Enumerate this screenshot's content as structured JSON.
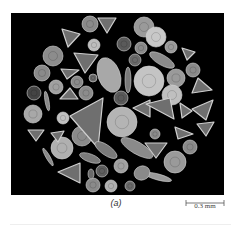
{
  "figure": {
    "panel_label": "(a)",
    "scale_bar": {
      "label": "0.3 mm"
    },
    "colors": {
      "background": "#000000",
      "specimen_light": "#c8c8c8",
      "specimen_mid": "#8c8c8c",
      "specimen_dark": "#5a5a5a",
      "page": "#ffffff"
    }
  },
  "specimens": {
    "circles": [
      [
        90,
        24,
        8,
        "#8a8a8a"
      ],
      [
        144,
        27,
        10,
        "#9a9a9a"
      ],
      [
        156,
        37,
        10,
        "#c8c8c8"
      ],
      [
        94,
        45,
        6,
        "#bdbdbd"
      ],
      [
        124,
        44,
        7,
        "#5a5a5a"
      ],
      [
        141,
        48,
        6,
        "#8a8a8a"
      ],
      [
        171,
        47,
        6,
        "#9a9a9a"
      ],
      [
        53,
        56,
        10,
        "#8c8c8c"
      ],
      [
        135,
        60,
        6,
        "#6a6a6a"
      ],
      [
        42,
        73,
        8,
        "#8a8a8a"
      ],
      [
        149,
        81,
        15,
        "#c4c4c4"
      ],
      [
        176,
        78,
        9,
        "#9a9a9a"
      ],
      [
        77,
        82,
        6,
        "#8a8a8a"
      ],
      [
        93,
        78,
        4,
        "#6a6a6a"
      ],
      [
        193,
        70,
        7,
        "#8a8a8a"
      ],
      [
        56,
        87,
        7,
        "#a0a0a0"
      ],
      [
        34,
        93,
        7,
        "#444444"
      ],
      [
        86,
        93,
        7,
        "#8c8c8c"
      ],
      [
        121,
        98,
        7,
        "#5a5a5a"
      ],
      [
        172,
        95,
        10,
        "#bfbfbf"
      ],
      [
        33,
        114,
        9,
        "#a8a8a8"
      ],
      [
        63,
        118,
        6,
        "#c0c0c0"
      ],
      [
        122,
        122,
        15,
        "#b4b4b4"
      ],
      [
        82,
        136,
        10,
        "#8a8a8a"
      ],
      [
        155,
        134,
        5,
        "#8a8a8a"
      ],
      [
        62,
        148,
        11,
        "#b0b0b0"
      ],
      [
        190,
        147,
        7,
        "#8a8a8a"
      ],
      [
        175,
        162,
        11,
        "#9a9a9a"
      ],
      [
        121,
        166,
        7,
        "#a0a0a0"
      ],
      [
        102,
        171,
        6,
        "#5e5e5e"
      ],
      [
        93,
        185,
        7,
        "#8a8a8a"
      ],
      [
        111,
        186,
        6,
        "#b0b0b0"
      ],
      [
        130,
        186,
        5,
        "#6a6a6a"
      ]
    ],
    "triangles": [
      [
        [
          62,
          29
        ],
        [
          80,
          34
        ],
        [
          68,
          47
        ]
      ],
      [
        [
          98,
          18
        ],
        [
          116,
          18
        ],
        [
          107,
          33
        ]
      ],
      [
        [
          74,
          53
        ],
        [
          98,
          55
        ],
        [
          85,
          73
        ]
      ],
      [
        [
          61,
          69
        ],
        [
          79,
          70
        ],
        [
          67,
          79
        ]
      ],
      [
        [
          60,
          99
        ],
        [
          78,
          99
        ],
        [
          70,
          88
        ]
      ],
      [
        [
          70,
          116
        ],
        [
          103,
          98
        ],
        [
          98,
          148
        ]
      ],
      [
        [
          133,
          108
        ],
        [
          150,
          100
        ],
        [
          150,
          117
        ]
      ],
      [
        [
          146,
          104
        ],
        [
          170,
          98
        ],
        [
          174,
          119
        ]
      ],
      [
        [
          198,
          78
        ],
        [
          212,
          90
        ],
        [
          192,
          93
        ]
      ],
      [
        [
          192,
          109
        ],
        [
          213,
          100
        ],
        [
          206,
          120
        ]
      ],
      [
        [
          175,
          127
        ],
        [
          193,
          134
        ],
        [
          178,
          139
        ]
      ],
      [
        [
          197,
          124
        ],
        [
          214,
          122
        ],
        [
          206,
          136
        ]
      ],
      [
        [
          28,
          130
        ],
        [
          44,
          130
        ],
        [
          36,
          141
        ]
      ],
      [
        [
          51,
          133
        ],
        [
          64,
          131
        ],
        [
          58,
          142
        ]
      ],
      [
        [
          58,
          172
        ],
        [
          80,
          163
        ],
        [
          80,
          183
        ]
      ],
      [
        [
          145,
          143
        ],
        [
          167,
          143
        ],
        [
          156,
          158
        ]
      ],
      [
        [
          180,
          103
        ],
        [
          192,
          111
        ],
        [
          182,
          118
        ]
      ],
      [
        [
          182,
          48
        ],
        [
          195,
          52
        ],
        [
          187,
          60
        ]
      ]
    ],
    "ellipses": [
      [
        109,
        75,
        11,
        18,
        "#a8a8a8",
        -20
      ],
      [
        128,
        80,
        3,
        13,
        "#7a7a7a",
        0
      ],
      [
        162,
        60,
        5,
        14,
        "#8a8a8a",
        -60
      ],
      [
        47,
        101,
        2,
        10,
        "#8a8a8a",
        -10
      ],
      [
        106,
        150,
        5,
        13,
        "#7a7a7a",
        -55
      ],
      [
        137,
        148,
        6,
        18,
        "#8a8a8a",
        -60
      ],
      [
        90,
        158,
        4,
        11,
        "#7a7a7a",
        -70
      ],
      [
        48,
        157,
        2,
        10,
        "#8a8a8a",
        -30
      ],
      [
        158,
        177,
        3,
        14,
        "#9a9a9a",
        -75
      ],
      [
        142,
        173,
        8,
        7,
        "#8a8a8a",
        -20
      ],
      [
        91,
        174,
        3,
        5,
        "#6a6a6a",
        0
      ]
    ]
  }
}
